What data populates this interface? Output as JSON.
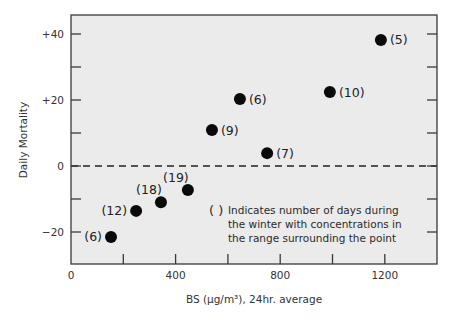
{
  "chart_data": {
    "type": "scatter",
    "title": "",
    "xlabel": "BS (µg/m³), 24hr. average",
    "ylabel": "Daily Mortality",
    "xlim": [
      0,
      1400
    ],
    "ylim": [
      -30,
      45
    ],
    "x_ticks": [
      {
        "value": 0,
        "label": "0"
      },
      {
        "value": 200,
        "label": ""
      },
      {
        "value": 400,
        "label": "400"
      },
      {
        "value": 600,
        "label": ""
      },
      {
        "value": 800,
        "label": "800"
      },
      {
        "value": 1000,
        "label": ""
      },
      {
        "value": 1200,
        "label": "1200"
      }
    ],
    "y_ticks": [
      {
        "value": 40,
        "label": "+40"
      },
      {
        "value": 30,
        "label": ""
      },
      {
        "value": 20,
        "label": "+20"
      },
      {
        "value": 10,
        "label": ""
      },
      {
        "value": 0,
        "label": "0"
      },
      {
        "value": -10,
        "label": ""
      },
      {
        "value": -20,
        "label": "−20"
      }
    ],
    "reference_line": {
      "y": 0,
      "style": "dashed"
    },
    "grid": false,
    "legend": null,
    "series": [
      {
        "name": "Daily Mortality vs BS",
        "points": [
          {
            "x": 153,
            "y": -21.5,
            "label": "(6)",
            "label_pos": "left"
          },
          {
            "x": 249,
            "y": -13.6,
            "label": "(12)",
            "label_pos": "left"
          },
          {
            "x": 344,
            "y": -11,
            "label": "(18)",
            "label_pos": "upper-left"
          },
          {
            "x": 447,
            "y": -7.3,
            "label": "(19)",
            "label_pos": "upper-left"
          },
          {
            "x": 539,
            "y": 10.9,
            "label": "(9)",
            "label_pos": "right"
          },
          {
            "x": 646,
            "y": 20.3,
            "label": "(6)",
            "label_pos": "right"
          },
          {
            "x": 750,
            "y": 3.9,
            "label": "(7)",
            "label_pos": "right"
          },
          {
            "x": 990,
            "y": 22.4,
            "label": "(10)",
            "label_pos": "right"
          },
          {
            "x": 1185,
            "y": 38.2,
            "label": "(5)",
            "label_pos": "right"
          }
        ]
      }
    ],
    "annotations": [
      {
        "marker": "( )",
        "lines": [
          "Indicates number of days during",
          "the winter with concentrations in",
          "the range surrounding the point"
        ]
      }
    ]
  },
  "colors": {
    "plot_background": "#ebebeb",
    "frame": "#3a3a3a",
    "point": "#0a0a0a",
    "text": "#2a2a2a"
  }
}
